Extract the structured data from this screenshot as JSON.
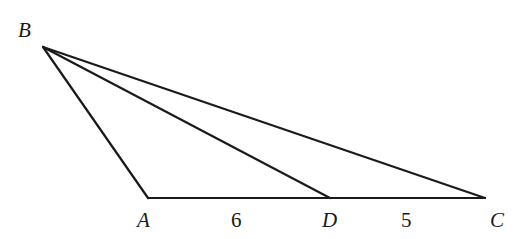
{
  "figure": {
    "type": "triangle-with-cevian",
    "vertices": [
      {
        "name": "B",
        "label": "B"
      },
      {
        "name": "A",
        "label": "A"
      },
      {
        "name": "D",
        "label": "D"
      },
      {
        "name": "C",
        "label": "C"
      }
    ],
    "segments": [
      {
        "from": "B",
        "to": "A"
      },
      {
        "from": "B",
        "to": "D"
      },
      {
        "from": "B",
        "to": "C"
      },
      {
        "from": "A",
        "to": "C"
      }
    ],
    "lengths": [
      {
        "segment": "AD",
        "label": "6"
      },
      {
        "segment": "DC",
        "label": "5"
      }
    ],
    "colors": {
      "line": "#1a1a1a",
      "background": "#ffffff"
    }
  }
}
